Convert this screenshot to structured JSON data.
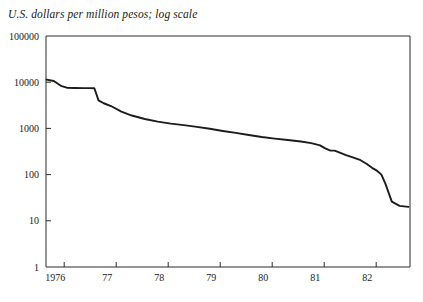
{
  "chart_data": {
    "type": "line",
    "title": "U.S. dollars per million pesos; log scale",
    "xlabel": "",
    "ylabel": "",
    "yscale": "log",
    "ylim": [
      1,
      100000
    ],
    "xlim": [
      1975.65,
      1982.65
    ],
    "grid": false,
    "legend": null,
    "y_ticks": [
      {
        "value": 100000,
        "label": "100000"
      },
      {
        "value": 10000,
        "label": "10000"
      },
      {
        "value": 1000,
        "label": "1000"
      },
      {
        "value": 100,
        "label": "100"
      },
      {
        "value": 10,
        "label": "10"
      },
      {
        "value": 1,
        "label": "1"
      }
    ],
    "x_ticks": [
      {
        "value": 1976.0,
        "label": ""
      },
      {
        "value": 1977.0,
        "label": ""
      },
      {
        "value": 1978.0,
        "label": ""
      },
      {
        "value": 1979.0,
        "label": ""
      },
      {
        "value": 1980.0,
        "label": ""
      },
      {
        "value": 1981.0,
        "label": ""
      },
      {
        "value": 1982.0,
        "label": ""
      }
    ],
    "x_tick_labels": [
      {
        "value": 1975.83,
        "label": "1976"
      },
      {
        "value": 1976.83,
        "label": "77"
      },
      {
        "value": 1977.83,
        "label": "78"
      },
      {
        "value": 1978.83,
        "label": "79"
      },
      {
        "value": 1979.83,
        "label": "80"
      },
      {
        "value": 1980.83,
        "label": "81"
      },
      {
        "value": 1981.83,
        "label": "82"
      }
    ],
    "series": [
      {
        "name": "U.S. dollars per million pesos",
        "color": "#1c1c1c",
        "x": [
          1975.66,
          1975.8,
          1975.95,
          1976.05,
          1976.2,
          1976.38,
          1976.48,
          1976.58,
          1976.66,
          1976.76,
          1976.9,
          1977.1,
          1977.3,
          1977.55,
          1977.8,
          1978.05,
          1978.3,
          1978.55,
          1978.8,
          1979.05,
          1979.3,
          1979.55,
          1979.8,
          1980.05,
          1980.3,
          1980.55,
          1980.75,
          1980.92,
          1981.02,
          1981.12,
          1981.2,
          1981.3,
          1981.42,
          1981.55,
          1981.7,
          1981.82,
          1981.92,
          1982.02,
          1982.1,
          1982.18,
          1982.3,
          1982.45,
          1982.62
        ],
        "y": [
          11400,
          10600,
          8200,
          7600,
          7500,
          7450,
          7430,
          7400,
          4050,
          3500,
          3050,
          2300,
          1900,
          1600,
          1400,
          1270,
          1180,
          1080,
          980,
          880,
          800,
          720,
          650,
          600,
          560,
          520,
          480,
          430,
          370,
          330,
          330,
          300,
          265,
          235,
          205,
          170,
          140,
          120,
          100,
          62,
          26,
          21,
          20
        ]
      }
    ]
  }
}
